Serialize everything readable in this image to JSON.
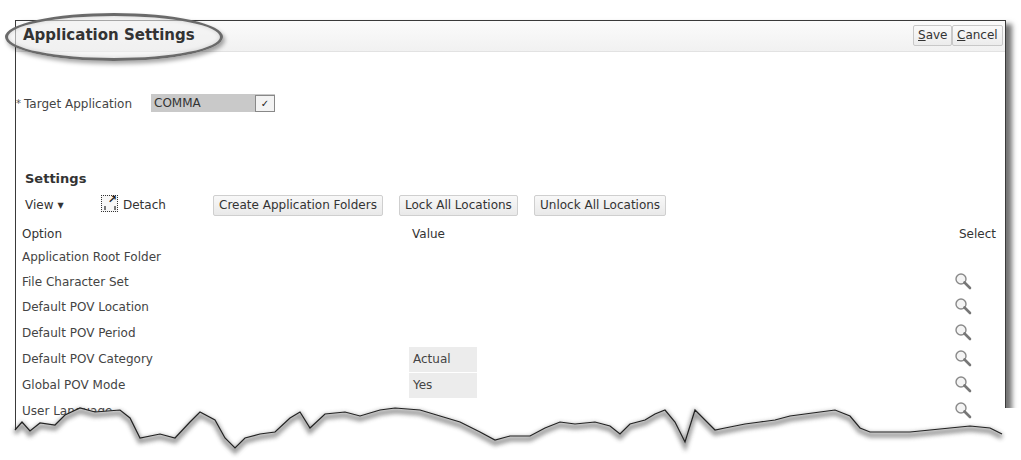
{
  "header": {
    "title": "Application Settings",
    "save_label": "Save",
    "save_accel": "S",
    "save_rest": "ave",
    "cancel_label": "Cancel",
    "cancel_accel": "C",
    "cancel_rest": "ancel"
  },
  "target_application": {
    "required_marker": "*",
    "label": "Target Application",
    "value": "COMMA",
    "dropdown_icon": "chevron-down"
  },
  "settings": {
    "section_title": "Settings",
    "toolbar": {
      "view_label": "View",
      "detach_label": "Detach",
      "buttons": [
        {
          "label": "Create Application Folders"
        },
        {
          "label": "Lock All Locations"
        },
        {
          "label": "Unlock All Locations"
        }
      ]
    },
    "table": {
      "columns": {
        "option": "Option",
        "value": "Value",
        "select": "Select"
      },
      "rows": [
        {
          "option": "Application Root Folder",
          "value": "",
          "has_select": false
        },
        {
          "option": "File Character Set",
          "value": "",
          "has_select": true
        },
        {
          "option": "Default POV Location",
          "value": "",
          "has_select": true
        },
        {
          "option": "Default POV Period",
          "value": "",
          "has_select": true
        },
        {
          "option": "Default POV Category",
          "value": "Actual",
          "has_select": true
        },
        {
          "option": "Global POV Mode",
          "value": "Yes",
          "has_select": true
        },
        {
          "option": "User Language",
          "value": "",
          "has_select": true
        }
      ]
    }
  },
  "colors": {
    "frame_border": "#3a3a3a",
    "select_bg": "#c9c9c9",
    "value_cell_bg": "#ececec",
    "highlight_oval": "#6a6a6a"
  }
}
